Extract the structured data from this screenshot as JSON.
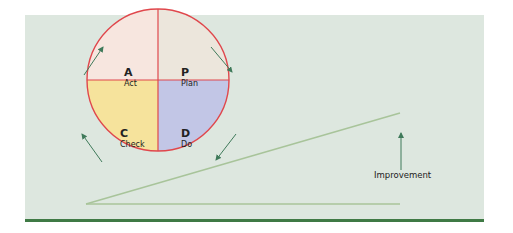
{
  "diagram": {
    "quadrants": [
      {
        "letter": "A",
        "label": "Act",
        "color": "#f7e6df"
      },
      {
        "letter": "P",
        "label": "Plan",
        "color": "#ece6dc"
      },
      {
        "letter": "C",
        "label": "Check",
        "color": "#f6e39c"
      },
      {
        "letter": "D",
        "label": "Do",
        "color": "#c2c6e6"
      }
    ],
    "improvement_label": "Improvement",
    "colors": {
      "panel_bg": "#dde7df",
      "circle_stroke": "#e0474c",
      "arrow": "#3f7a5a",
      "slope": "#a8c49a",
      "bottom_rule": "#3f7a45"
    }
  }
}
